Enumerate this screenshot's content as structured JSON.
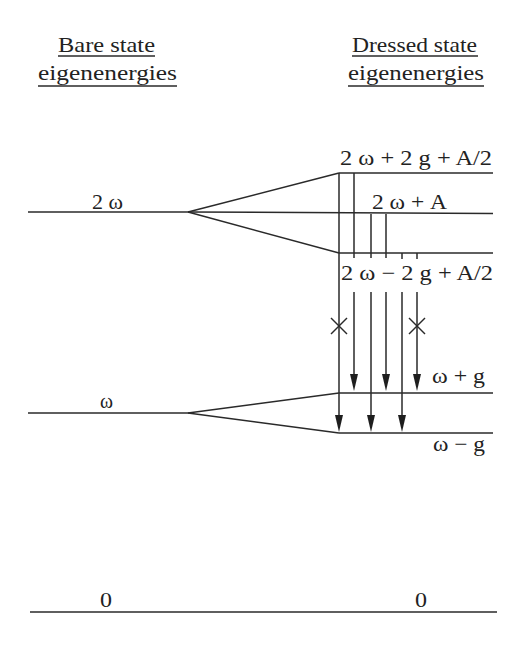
{
  "headers": {
    "bare": {
      "line1": "Bare state",
      "line2": "eigenenergies"
    },
    "dressed": {
      "line1": "Dressed state",
      "line2": "eigenenergies"
    }
  },
  "bare_levels": [
    {
      "id": "2w",
      "label": "2 ω"
    },
    {
      "id": "w",
      "label": "ω"
    },
    {
      "id": "0",
      "label": "0"
    }
  ],
  "dressed_levels": [
    {
      "id": "2w+2g+A/2",
      "label": "2 ω + 2 g + A/2"
    },
    {
      "id": "2w+A",
      "label": "2 ω + A"
    },
    {
      "id": "2w-2g+A/2",
      "label": "2 ω − 2 g + A/2"
    },
    {
      "id": "w+g",
      "label": "ω + g"
    },
    {
      "id": "w-g",
      "label": "ω − g"
    },
    {
      "id": "0",
      "label": "0"
    }
  ],
  "transitions": [
    {
      "from": "2 ω + 2 g + A/2",
      "to": "ω − g",
      "forbidden": true
    },
    {
      "from": "2 ω + 2 g + A/2",
      "to": "ω + g",
      "forbidden": false
    },
    {
      "from": "2 ω + A",
      "to": "ω − g",
      "forbidden": false
    },
    {
      "from": "2 ω + A",
      "to": "ω + g",
      "forbidden": false
    },
    {
      "from": "2 ω − 2 g + A/2",
      "to": "ω − g",
      "forbidden": false
    },
    {
      "from": "2 ω − 2 g + A/2",
      "to": "ω + g",
      "forbidden": true
    }
  ],
  "colors": {
    "ink": "#222222",
    "background": "#ffffff"
  }
}
